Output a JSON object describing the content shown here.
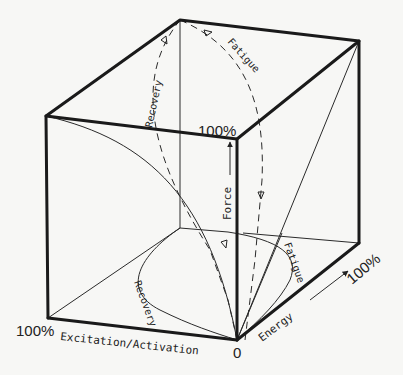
{
  "diagram": {
    "axes": {
      "force": {
        "label": "Force",
        "max_label": "100%"
      },
      "excitation": {
        "label": "Excitation/Activation",
        "max_label": "100%"
      },
      "energy": {
        "label": "Energy",
        "max_label": "100%"
      },
      "origin_label": "0"
    },
    "curves": {
      "top_recovery": "Recovery",
      "top_fatigue": "Fatigue",
      "bottom_recovery": "Recovery",
      "bottom_fatigue": "Fatigue"
    },
    "colors": {
      "line": "#1a1a1a",
      "background": "#f7f7f5"
    }
  }
}
